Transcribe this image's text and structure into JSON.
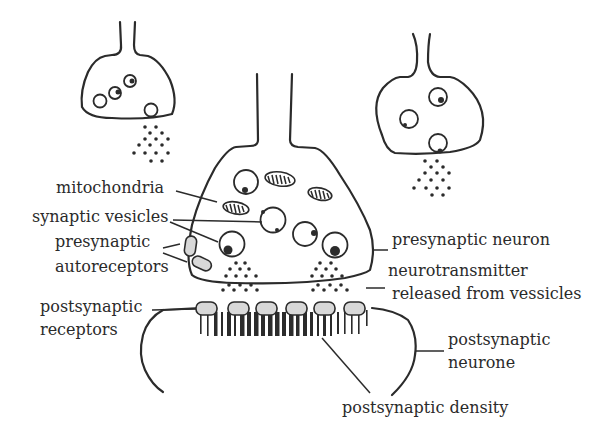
{
  "diagram": {
    "colors": {
      "ink": "#2b2b2b",
      "receptor_fill": "#d8d8d8",
      "background": "#ffffff"
    },
    "labels": {
      "mitochondria": "mitochondria",
      "synaptic_vesicles": "synaptic vesicles",
      "presynaptic_autoreceptors_1": "presynaptic",
      "presynaptic_autoreceptors_2": "autoreceptors",
      "presynaptic_neuron": "presynaptic neuron",
      "neurotransmitter_1": "neurotransmitter",
      "neurotransmitter_2": "released from vessicles",
      "postsynaptic_receptors_1": "postsynaptic",
      "postsynaptic_receptors_2": "receptors",
      "postsynaptic_neurone_1": "postsynaptic",
      "postsynaptic_neurone_2": "neurone",
      "postsynaptic_density": "postsynaptic density"
    },
    "nodes": [
      "left presynaptic terminal",
      "right presynaptic terminal",
      "central presynaptic neuron",
      "postsynaptic neurone"
    ]
  }
}
